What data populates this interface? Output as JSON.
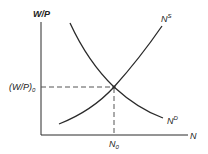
{
  "diagram": {
    "y_axis_label": "W/P",
    "x_axis_label": "N",
    "equilibrium_wage_label": "(W/P)",
    "equilibrium_wage_subscript": "0",
    "equilibrium_employment_label": "N",
    "equilibrium_employment_subscript": "0",
    "supply_curve": {
      "label": "N",
      "superscript": "S"
    },
    "demand_curve": {
      "label": "N",
      "superscript": "D"
    },
    "colors": {
      "line": "#2a2a2a",
      "dashed": "#555555",
      "background": "#ffffff"
    }
  }
}
